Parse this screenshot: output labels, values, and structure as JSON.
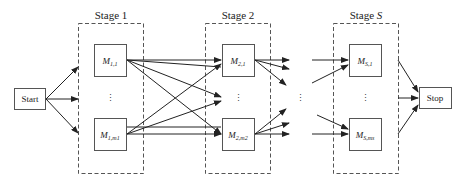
{
  "diagram": {
    "type": "multi-stage flow shop",
    "start": {
      "label": "Start"
    },
    "stop": {
      "label": "Stop"
    },
    "stages": [
      {
        "title": "Stage 1",
        "title_prefix": "Stage ",
        "title_index": "1",
        "machines": [
          {
            "name": "M",
            "sub": "1,1"
          },
          {
            "name": "M",
            "sub": "1,m1"
          }
        ],
        "ellipsis": "⋮"
      },
      {
        "title": "Stage 2",
        "title_prefix": "Stage ",
        "title_index": "2",
        "machines": [
          {
            "name": "M",
            "sub": "2,1"
          },
          {
            "name": "M",
            "sub": "2,m2"
          }
        ],
        "ellipsis": "⋮"
      },
      {
        "title": "Stage S",
        "title_prefix": "Stage ",
        "title_index": "S",
        "machines": [
          {
            "name": "M",
            "sub": "S,1"
          },
          {
            "name": "M",
            "sub": "S,ms"
          }
        ],
        "ellipsis": "⋮"
      }
    ],
    "between_stages_ellipsis": "⋮",
    "colors": {
      "line": "#222222",
      "box_border": "#555555",
      "dashed_border": "#555555",
      "background": "#ffffff"
    }
  }
}
